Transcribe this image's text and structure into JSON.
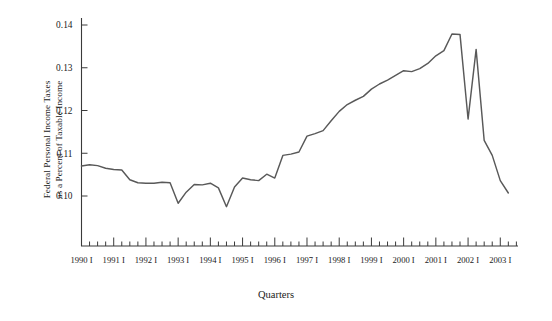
{
  "chart_data": {
    "type": "line",
    "title": "",
    "xlabel": "Quarters",
    "ylabel_line1": "Federal Personal Income Taxes",
    "ylabel_line2": "as a Percent of Taxable Income",
    "ylim": [
      0.095,
      0.14
    ],
    "yticks": [
      0.1,
      0.11,
      0.12,
      0.13,
      0.14
    ],
    "ytick_labels": [
      "0.10",
      "0.11",
      "0.12",
      "0.13",
      "0.14"
    ],
    "xtick_labels": [
      "1990 I",
      "1991 I",
      "1992 I",
      "1993 I",
      "1994 I",
      "1995 I",
      "1996 I",
      "1997 I",
      "1998 I",
      "1999 I",
      "2000 I",
      "2001 I",
      "2002 I",
      "2003 I"
    ],
    "minor_ticks_per_year": 4,
    "grid": false,
    "legend": null,
    "line_color": "#595959",
    "axis_color": "#3a3a3a",
    "x_start_quarter": 0,
    "x_end_quarter": 53,
    "series": [
      {
        "name": "Federal Personal Income Taxes as a Percent of Taxable Income",
        "x": [
          "1990 I",
          "1990 II",
          "1990 III",
          "1990 IV",
          "1991 I",
          "1991 II",
          "1991 III",
          "1991 IV",
          "1992 I",
          "1992 II",
          "1992 III",
          "1992 IV",
          "1993 I",
          "1993 II",
          "1993 III",
          "1993 IV",
          "1994 I",
          "1994 II",
          "1994 III",
          "1994 IV",
          "1995 I",
          "1995 II",
          "1995 III",
          "1995 IV",
          "1996 I",
          "1996 II",
          "1996 III",
          "1996 IV",
          "1997 I",
          "1997 II",
          "1997 III",
          "1997 IV",
          "1998 I",
          "1998 II",
          "1998 III",
          "1998 IV",
          "1999 I",
          "1999 II",
          "1999 III",
          "1999 IV",
          "2000 I",
          "2000 II",
          "2000 III",
          "2000 IV",
          "2001 I",
          "2001 II",
          "2001 III",
          "2001 IV",
          "2002 I",
          "2002 II",
          "2002 III",
          "2002 IV",
          "2003 I",
          "2003 II"
        ],
        "values": [
          0.107,
          0.1073,
          0.1071,
          0.1065,
          0.1062,
          0.1061,
          0.1038,
          0.1031,
          0.103,
          0.103,
          0.1032,
          0.1031,
          0.0983,
          0.1009,
          0.1027,
          0.1026,
          0.103,
          0.1019,
          0.0975,
          0.1021,
          0.1042,
          0.1038,
          0.1036,
          0.1051,
          0.1042,
          0.1095,
          0.1098,
          0.1103,
          0.114,
          0.1146,
          0.1153,
          0.1176,
          0.1198,
          0.1214,
          0.1224,
          0.1233,
          0.125,
          0.1262,
          0.1271,
          0.1282,
          0.1293,
          0.1291,
          0.1298,
          0.131,
          0.1328,
          0.134,
          0.1379,
          0.1378,
          0.118,
          0.1343,
          0.113,
          0.1095,
          0.1036,
          0.1007
        ]
      }
    ]
  }
}
